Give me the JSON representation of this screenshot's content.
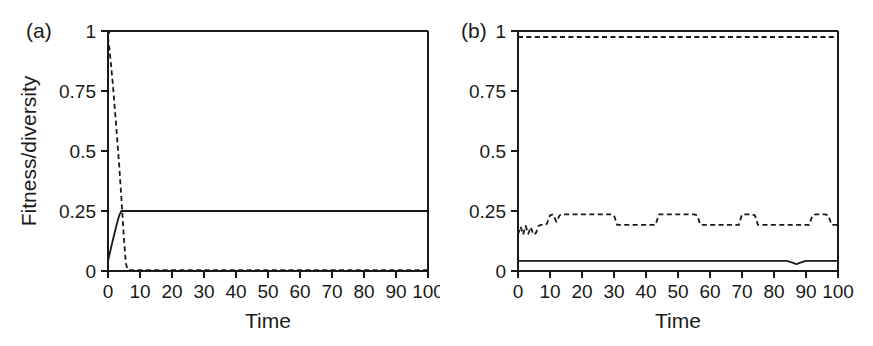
{
  "figure": {
    "background_color": "#ffffff",
    "ink_color": "#1a1a1a",
    "panel_a_tag": "(a)",
    "panel_b_tag": "(b)",
    "shared_ylabel": "Fitness/diversity",
    "shared_xlabel": "Time"
  },
  "chart_data": [
    {
      "id": "panel-a",
      "type": "line",
      "title": "(a)",
      "xlabel": "Time",
      "ylabel": "Fitness/diversity",
      "xlim": [
        0,
        100
      ],
      "ylim": [
        0,
        1
      ],
      "grid": false,
      "legend": "none",
      "xticks": [
        0,
        10,
        20,
        30,
        40,
        50,
        60,
        70,
        80,
        90,
        100
      ],
      "xtick_labels": [
        "0",
        "10",
        "20",
        "30",
        "40",
        "50",
        "60",
        "70",
        "80",
        "90",
        "100"
      ],
      "yticks": [
        0,
        0.25,
        0.5,
        0.75,
        1
      ],
      "ytick_labels": [
        "0",
        "0.25",
        "0.5",
        "0.75",
        "1"
      ],
      "series": [
        {
          "name": "fitness-top",
          "style": "solid",
          "x": [
            0,
            0.6,
            100
          ],
          "values": [
            0.985,
            1.0,
            1.0
          ]
        },
        {
          "name": "fitness-mid",
          "style": "solid",
          "x": [
            0,
            1,
            2,
            3,
            3.6,
            4.2,
            100
          ],
          "values": [
            0.04,
            0.1,
            0.155,
            0.208,
            0.235,
            0.25,
            0.25
          ]
        },
        {
          "name": "diversity-decay",
          "style": "dashed",
          "x": [
            0,
            0.5,
            1.5,
            2.5,
            3.5,
            4.3,
            5.0,
            5.6,
            6.2,
            100
          ],
          "values": [
            0.975,
            0.92,
            0.78,
            0.615,
            0.44,
            0.28,
            0.13,
            0.03,
            0.004,
            0.004
          ]
        },
        {
          "name": "baseline-zero",
          "style": "solid",
          "x": [
            0,
            100
          ],
          "values": [
            0.0,
            0.0
          ]
        }
      ]
    },
    {
      "id": "panel-b",
      "type": "line",
      "title": "(b)",
      "xlabel": "Time",
      "ylabel": "Fitness/diversity",
      "xlim": [
        0,
        100
      ],
      "ylim": [
        0,
        1
      ],
      "grid": false,
      "legend": "none",
      "xticks": [
        0,
        10,
        20,
        30,
        40,
        50,
        60,
        70,
        80,
        90,
        100
      ],
      "xtick_labels": [
        "0",
        "10",
        "20",
        "30",
        "40",
        "50",
        "60",
        "70",
        "80",
        "90",
        "100"
      ],
      "yticks": [
        0,
        0.25,
        0.5,
        0.75,
        1
      ],
      "ytick_labels": [
        "0",
        "0.25",
        "0.5",
        "0.75",
        "1"
      ],
      "series": [
        {
          "name": "fitness-top",
          "style": "solid",
          "x": [
            0,
            100
          ],
          "values": [
            1.0,
            1.0
          ]
        },
        {
          "name": "diversity-top",
          "style": "dashed",
          "x": [
            0,
            100
          ],
          "values": [
            0.975,
            0.975
          ]
        },
        {
          "name": "diversity-oscillating",
          "style": "dashed",
          "x": [
            0,
            0.8,
            1.6,
            2.4,
            3.2,
            4.0,
            4.8,
            5.6,
            6.4,
            7.2,
            8.0,
            9.0,
            10.0,
            11.0,
            12.0,
            13.0,
            14.0,
            15.0,
            16.0,
            29.0,
            30.0,
            31.0,
            42.0,
            43.0,
            44.0,
            55.0,
            56.0,
            57.0,
            68.0,
            69.0,
            70.0,
            73.0,
            74.0,
            75.0,
            91.0,
            92.0,
            93.0,
            96.0,
            97.0,
            98.0,
            100.0
          ],
          "values": [
            0.152,
            0.185,
            0.152,
            0.188,
            0.155,
            0.183,
            0.152,
            0.158,
            0.188,
            0.192,
            0.192,
            0.196,
            0.232,
            0.236,
            0.205,
            0.232,
            0.236,
            0.236,
            0.236,
            0.236,
            0.232,
            0.192,
            0.192,
            0.192,
            0.236,
            0.236,
            0.232,
            0.192,
            0.192,
            0.192,
            0.236,
            0.236,
            0.232,
            0.192,
            0.192,
            0.232,
            0.236,
            0.236,
            0.232,
            0.192,
            0.192
          ]
        },
        {
          "name": "fitness-low",
          "style": "solid",
          "x": [
            0,
            84,
            86,
            87,
            88,
            90,
            100
          ],
          "values": [
            0.042,
            0.042,
            0.034,
            0.028,
            0.034,
            0.042,
            0.042
          ]
        },
        {
          "name": "baseline-zero",
          "style": "solid",
          "x": [
            0,
            100
          ],
          "values": [
            0.0,
            0.0
          ]
        }
      ]
    }
  ]
}
